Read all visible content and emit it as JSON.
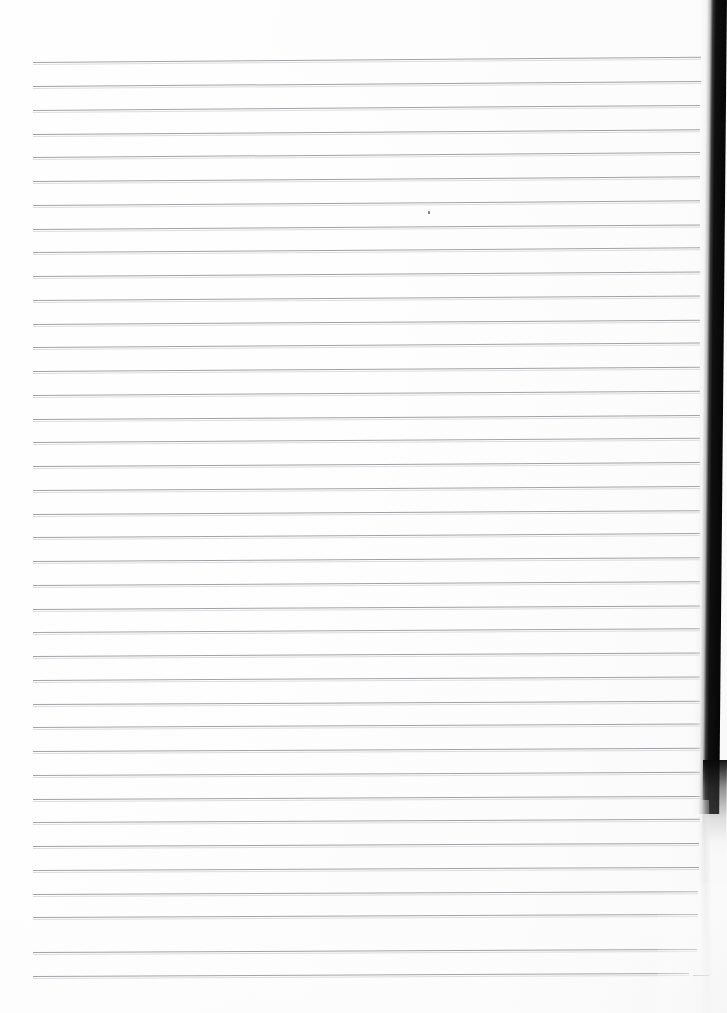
{
  "document": {
    "type": "scanned-lined-notebook-page",
    "title": "Blank Ruled Page",
    "content_text": "",
    "background_color": "#ffffff",
    "page_width": 727,
    "page_height": 1013
  },
  "ruling": {
    "line_color": "#9a9a9e",
    "line_count": 39,
    "first_line_y": 62,
    "line_spacing": 23.7,
    "left_x": 33,
    "right_x": 700,
    "stroke_width": 1,
    "lines": [
      {
        "y": 62,
        "left": 33,
        "right": 701,
        "tilt": -0.45,
        "opacity": 0.9
      },
      {
        "y": 86,
        "left": 33,
        "right": 701,
        "tilt": -0.42,
        "opacity": 0.92
      },
      {
        "y": 110,
        "left": 33,
        "right": 700,
        "tilt": -0.44,
        "opacity": 0.9
      },
      {
        "y": 134,
        "left": 33,
        "right": 700,
        "tilt": -0.4,
        "opacity": 0.93
      },
      {
        "y": 157,
        "left": 33,
        "right": 700,
        "tilt": -0.42,
        "opacity": 0.9
      },
      {
        "y": 181,
        "left": 33,
        "right": 700,
        "tilt": -0.4,
        "opacity": 0.92
      },
      {
        "y": 205,
        "left": 33,
        "right": 700,
        "tilt": -0.4,
        "opacity": 0.9
      },
      {
        "y": 229,
        "left": 33,
        "right": 700,
        "tilt": -0.38,
        "opacity": 0.92
      },
      {
        "y": 252,
        "left": 33,
        "right": 700,
        "tilt": -0.4,
        "opacity": 0.9
      },
      {
        "y": 276,
        "left": 33,
        "right": 700,
        "tilt": -0.38,
        "opacity": 0.92
      },
      {
        "y": 300,
        "left": 33,
        "right": 700,
        "tilt": -0.38,
        "opacity": 0.9
      },
      {
        "y": 324,
        "left": 33,
        "right": 700,
        "tilt": -0.36,
        "opacity": 0.92
      },
      {
        "y": 347,
        "left": 33,
        "right": 700,
        "tilt": -0.38,
        "opacity": 0.9
      },
      {
        "y": 371,
        "left": 33,
        "right": 700,
        "tilt": -0.36,
        "opacity": 0.92
      },
      {
        "y": 395,
        "left": 33,
        "right": 700,
        "tilt": -0.36,
        "opacity": 0.9
      },
      {
        "y": 419,
        "left": 33,
        "right": 700,
        "tilt": -0.34,
        "opacity": 0.92
      },
      {
        "y": 442,
        "left": 33,
        "right": 700,
        "tilt": -0.36,
        "opacity": 0.9
      },
      {
        "y": 466,
        "left": 33,
        "right": 700,
        "tilt": -0.34,
        "opacity": 0.92
      },
      {
        "y": 490,
        "left": 33,
        "right": 700,
        "tilt": -0.34,
        "opacity": 0.9
      },
      {
        "y": 514,
        "left": 33,
        "right": 700,
        "tilt": -0.32,
        "opacity": 0.92
      },
      {
        "y": 537,
        "left": 33,
        "right": 700,
        "tilt": -0.34,
        "opacity": 0.9
      },
      {
        "y": 561,
        "left": 33,
        "right": 700,
        "tilt": -0.32,
        "opacity": 0.92
      },
      {
        "y": 585,
        "left": 33,
        "right": 700,
        "tilt": -0.32,
        "opacity": 0.9
      },
      {
        "y": 609,
        "left": 33,
        "right": 700,
        "tilt": -0.3,
        "opacity": 0.92
      },
      {
        "y": 632,
        "left": 33,
        "right": 700,
        "tilt": -0.32,
        "opacity": 0.9
      },
      {
        "y": 656,
        "left": 33,
        "right": 700,
        "tilt": -0.3,
        "opacity": 0.92
      },
      {
        "y": 680,
        "left": 33,
        "right": 700,
        "tilt": -0.3,
        "opacity": 0.9
      },
      {
        "y": 704,
        "left": 33,
        "right": 700,
        "tilt": -0.28,
        "opacity": 0.92
      },
      {
        "y": 727,
        "left": 33,
        "right": 700,
        "tilt": -0.3,
        "opacity": 0.9
      },
      {
        "y": 751,
        "left": 33,
        "right": 700,
        "tilt": -0.28,
        "opacity": 0.92
      },
      {
        "y": 775,
        "left": 33,
        "right": 700,
        "tilt": -0.28,
        "opacity": 0.9
      },
      {
        "y": 799,
        "left": 33,
        "right": 700,
        "tilt": -0.26,
        "opacity": 0.92
      },
      {
        "y": 822,
        "left": 33,
        "right": 700,
        "tilt": -0.28,
        "opacity": 0.9
      },
      {
        "y": 846,
        "left": 33,
        "right": 699,
        "tilt": -0.26,
        "opacity": 0.92
      },
      {
        "y": 870,
        "left": 33,
        "right": 699,
        "tilt": -0.26,
        "opacity": 0.9
      },
      {
        "y": 894,
        "left": 33,
        "right": 698,
        "tilt": -0.24,
        "opacity": 0.92
      },
      {
        "y": 917,
        "left": 33,
        "right": 698,
        "tilt": -0.26,
        "opacity": 0.9
      },
      {
        "y": 952,
        "left": 33,
        "right": 697,
        "tilt": -0.26,
        "opacity": 0.92
      },
      {
        "y": 976,
        "left": 33,
        "right": 689,
        "tilt": -0.26,
        "opacity": 0.9
      }
    ]
  },
  "artifacts": {
    "scan_shadow_color": "#060606",
    "ink_speck": {
      "x": 428,
      "y": 211,
      "width": 2,
      "height": 3,
      "color": "#6d6d70"
    },
    "edge_dash": {
      "x": 693,
      "y": 975,
      "width": 16,
      "color": "#b6b6ba"
    }
  }
}
